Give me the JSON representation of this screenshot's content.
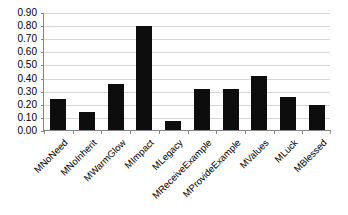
{
  "chart_data": {
    "type": "bar",
    "title": "",
    "xlabel": "",
    "ylabel": "",
    "ylim": [
      0.0,
      0.9
    ],
    "grid": true,
    "legend": "none",
    "categories": [
      "MNoNeed",
      "MNoInherit",
      "MWarmGlow",
      "MImpact",
      "MLegacy",
      "MReceiveExample",
      "MProvideExample",
      "MValues",
      "MLuck",
      "MBlessed"
    ],
    "values": [
      0.24,
      0.14,
      0.35,
      0.79,
      0.07,
      0.31,
      0.31,
      0.41,
      0.25,
      0.19
    ],
    "ytick_labels": [
      "0.00",
      "0.10",
      "0.20",
      "0.30",
      "0.40",
      "0.50",
      "0.60",
      "0.70",
      "0.80",
      "0.90"
    ],
    "ytick_values": [
      0.0,
      0.1,
      0.2,
      0.3,
      0.4,
      0.5,
      0.6,
      0.7,
      0.8,
      0.9
    ],
    "bar_color": "#0d0d0d",
    "gridline_color": "#d6d6d6",
    "axis_color": "#868686",
    "background_color": "#ffffff"
  }
}
